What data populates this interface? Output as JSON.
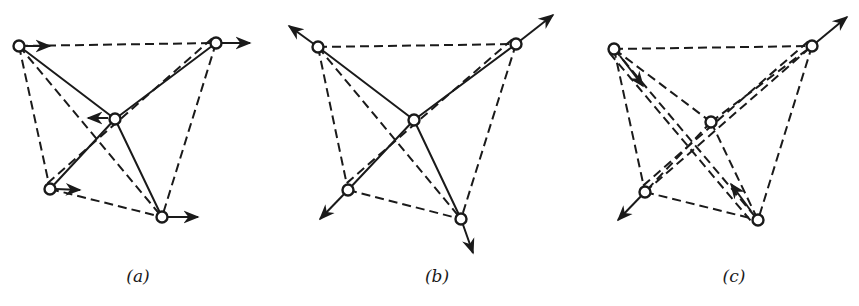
{
  "figure": {
    "colors": {
      "ink": "#1a1a1a",
      "background": "#ffffff"
    }
  },
  "panels": [
    {
      "id": "a",
      "caption": "(a)",
      "caption_x": 138,
      "nodes": {
        "TL": [
          19,
          46
        ],
        "TR": [
          216,
          43
        ],
        "C": [
          115,
          119
        ],
        "BL": [
          50,
          189
        ],
        "BR": [
          162,
          217
        ]
      },
      "solid_edges": [
        [
          "C",
          "TL"
        ],
        [
          "C",
          "TR"
        ],
        [
          "C",
          "BL"
        ],
        [
          "C",
          "BR"
        ]
      ],
      "dashed_edges": [
        [
          "TL",
          "TR"
        ],
        [
          "TL",
          "BL"
        ],
        [
          "TL",
          "BR"
        ],
        [
          "TR",
          "BR"
        ],
        [
          "TR",
          "BL"
        ],
        [
          "BL",
          "BR"
        ]
      ],
      "arrows": [
        {
          "from": [
            26,
            46
          ],
          "to": [
            50,
            46
          ],
          "label": "TL displacement right"
        },
        {
          "from": [
            222,
            43
          ],
          "to": [
            250,
            43
          ],
          "label": "TR displacement right"
        },
        {
          "from": [
            108,
            118
          ],
          "to": [
            88,
            118
          ],
          "label": "C displacement left"
        },
        {
          "from": [
            56,
            189
          ],
          "to": [
            80,
            190
          ],
          "label": "BL displacement right"
        },
        {
          "from": [
            168,
            217
          ],
          "to": [
            198,
            217
          ],
          "label": "BR displacement right"
        }
      ]
    },
    {
      "id": "b",
      "caption": "(b)",
      "caption_x": 437,
      "nodes": {
        "TL": [
          318,
          47
        ],
        "TR": [
          516,
          44
        ],
        "C": [
          414,
          120
        ],
        "BL": [
          348,
          190
        ],
        "BR": [
          461,
          219
        ]
      },
      "solid_edges": [
        [
          "C",
          "TL"
        ],
        [
          "C",
          "TR"
        ],
        [
          "C",
          "BL"
        ],
        [
          "C",
          "BR"
        ]
      ],
      "dashed_edges": [
        [
          "TL",
          "TR"
        ],
        [
          "TL",
          "BL"
        ],
        [
          "TL",
          "BR"
        ],
        [
          "TR",
          "BR"
        ],
        [
          "TR",
          "BL"
        ],
        [
          "BL",
          "BR"
        ]
      ],
      "arrows": [
        {
          "from": [
            318,
            47
          ],
          "to": [
            289,
            26
          ],
          "label": "TL displacement outward"
        },
        {
          "from": [
            516,
            44
          ],
          "to": [
            553,
            15
          ],
          "label": "TR displacement outward"
        },
        {
          "from": [
            348,
            190
          ],
          "to": [
            320,
            219
          ],
          "label": "BL displacement outward"
        },
        {
          "from": [
            461,
            219
          ],
          "to": [
            473,
            253
          ],
          "label": "BR displacement outward"
        }
      ]
    },
    {
      "id": "c",
      "caption": "(c)",
      "caption_x": 734,
      "nodes": {
        "TL": [
          614,
          49
        ],
        "TR": [
          812,
          46
        ],
        "C": [
          711,
          122
        ],
        "BL": [
          645,
          192
        ],
        "BR": [
          758,
          220
        ]
      },
      "solid_edges": [
        [
          "TL",
          "BR"
        ],
        [
          "BL",
          "TR"
        ]
      ],
      "dashed_edges": [
        [
          "C",
          "TL"
        ],
        [
          "C",
          "TR"
        ],
        [
          "C",
          "BL"
        ],
        [
          "C",
          "BR"
        ],
        [
          "TL",
          "TR"
        ],
        [
          "TL",
          "BL"
        ],
        [
          "TR",
          "BR"
        ],
        [
          "BL",
          "BR"
        ]
      ],
      "parallel_dashed": [
        [
          "TL",
          "BR"
        ],
        [
          "TR",
          "BL"
        ]
      ],
      "arrows": [
        {
          "from": [
            812,
            46
          ],
          "to": [
            847,
            17
          ],
          "label": "TR displacement outward"
        },
        {
          "from": [
            645,
            192
          ],
          "to": [
            618,
            220
          ],
          "label": "BL displacement outward"
        },
        {
          "from": [
            620,
            56
          ],
          "to": [
            643,
            86
          ],
          "label": "TL displacement toward BR"
        },
        {
          "from": [
            751,
            211
          ],
          "to": [
            731,
            184
          ],
          "label": "BR displacement toward TL"
        }
      ]
    }
  ]
}
